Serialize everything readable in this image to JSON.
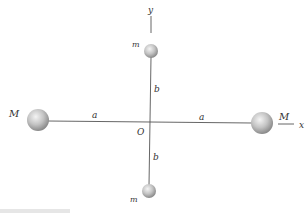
{
  "figure": {
    "axes": {
      "x_label": "x",
      "y_label": "y",
      "origin_label": "O"
    },
    "masses": {
      "large_left_label": "M",
      "large_right_label": "M",
      "small_top_label": "m",
      "small_bottom_label": "m"
    },
    "distances": {
      "left_horizontal": "a",
      "right_horizontal": "a",
      "upper_vertical": "b",
      "lower_vertical": "b"
    },
    "colors": {
      "line": "#555555",
      "sphere_light": "#f2f2f2",
      "sphere_dark": "#8a8a8a",
      "text": "#333333"
    }
  }
}
